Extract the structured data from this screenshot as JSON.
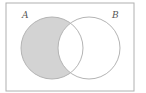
{
  "diagram": {
    "type": "venn",
    "universe": {
      "x": 6,
      "y": 3,
      "width": 128,
      "height": 88,
      "stroke": "#b0b0b0"
    },
    "sets": [
      {
        "name": "A",
        "label": "A",
        "cx": 52,
        "cy": 48,
        "r": 31,
        "label_x": 22,
        "label_y": 18
      },
      {
        "name": "B",
        "label": "B",
        "cx": 89,
        "cy": 48,
        "r": 31,
        "label_x": 112,
        "label_y": 18
      }
    ],
    "shaded_region": "A \\ B",
    "colors": {
      "fill": "#d3d3d3",
      "stroke": "#b4b4b4",
      "background": "#ffffff",
      "label": "#555555"
    }
  }
}
